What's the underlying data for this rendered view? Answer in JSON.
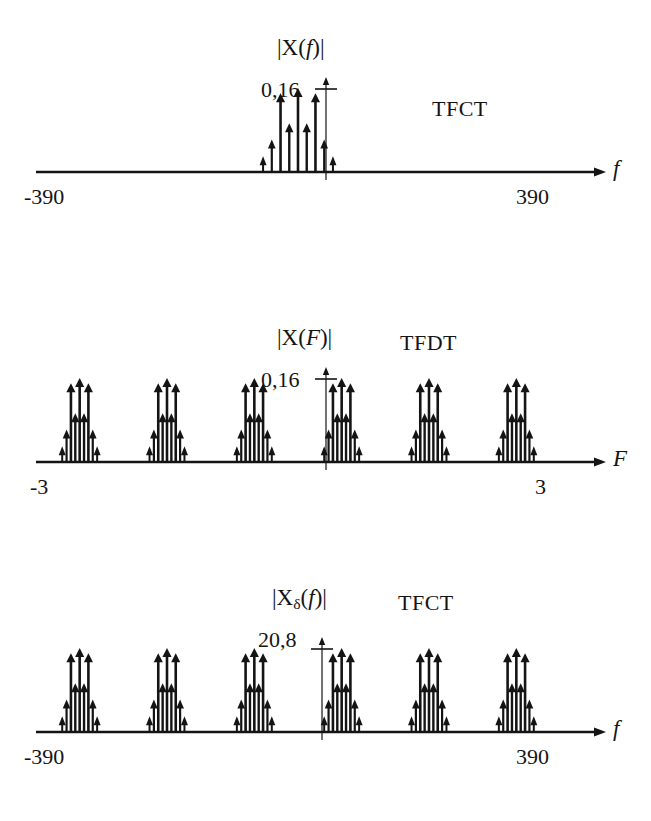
{
  "figure": {
    "background": "#ffffff",
    "ink_color": "#141414"
  },
  "panels": [
    {
      "id": "panel-0",
      "ylabel": "|X(f)|",
      "ylabel_parts": {
        "pre": "|X(",
        "var": "f",
        "post": ")|"
      },
      "ytick_label": "0,16",
      "method_label": "TFCT",
      "axis_var": "f",
      "x_left_label": "-390",
      "x_right_label": "390"
    },
    {
      "id": "panel-1",
      "ylabel": "|X(F)|",
      "ylabel_parts": {
        "pre": "|X(",
        "var": "F",
        "post": ")|"
      },
      "ytick_label": "0,16",
      "method_label": "TFDT",
      "axis_var": "F",
      "x_left_label": "-3",
      "x_right_label": "3"
    },
    {
      "id": "panel-2",
      "ylabel": "|Xδ(f)|",
      "ylabel_parts": {
        "pre": "|X",
        "sub": "δ",
        "mid": "(",
        "var": "f",
        "post": ")|"
      },
      "ytick_label": "20,8",
      "method_label": "TFCT",
      "axis_var": "f",
      "x_left_label": "-390",
      "x_right_label": "390"
    }
  ],
  "chart_data": [
    {
      "type": "line_spectrum",
      "panel": "panel-0",
      "title": "|X(f)|",
      "method": "TFCT",
      "xlabel": "f",
      "ylabel": "|X(f)|",
      "xlim": [
        -390,
        390
      ],
      "ylim": [
        0,
        0.18
      ],
      "ytick_values": [
        0.16
      ],
      "ytick_labels": [
        "0,16"
      ],
      "xtick_values": [
        -390,
        390
      ],
      "xtick_labels": [
        "-390",
        "390"
      ],
      "grid": false,
      "legend": "none",
      "comb_spacing_hz": 13,
      "group_count": 1,
      "lines_per_group": 9,
      "x": [
        -52,
        -39,
        -26,
        -13,
        0,
        13,
        26,
        39,
        52
      ],
      "values": [
        0.03,
        0.062,
        0.15,
        0.093,
        0.16,
        0.093,
        0.15,
        0.062,
        0.03
      ]
    },
    {
      "type": "line_spectrum",
      "panel": "panel-1",
      "title": "|X(F)|",
      "method": "TFDT",
      "xlabel": "F",
      "ylabel": "|X(F)|",
      "xlim": [
        -3,
        3
      ],
      "ylim": [
        0,
        0.18
      ],
      "ytick_values": [
        0.16
      ],
      "ytick_labels": [
        "0,16"
      ],
      "xtick_values": [
        -3,
        3
      ],
      "xtick_labels": [
        "-3",
        "3"
      ],
      "grid": false,
      "legend": "none",
      "periodic": true,
      "period": 1,
      "group_centers": [
        -2.5,
        -1.5,
        -0.5,
        0.5,
        1.5,
        2.5
      ],
      "lines_per_group": 9,
      "group_offsets": [
        -0.2,
        -0.15,
        -0.1,
        -0.05,
        0,
        0.05,
        0.1,
        0.15,
        0.2
      ],
      "group_values": [
        0.03,
        0.062,
        0.15,
        0.093,
        0.16,
        0.093,
        0.15,
        0.062,
        0.03
      ]
    },
    {
      "type": "line_spectrum",
      "panel": "panel-2",
      "title": "|Xδ(f)|",
      "method": "TFCT",
      "xlabel": "f",
      "ylabel": "|Xδ(f)|",
      "xlim": [
        -390,
        390
      ],
      "ylim": [
        0,
        23.4
      ],
      "ytick_values": [
        20.8
      ],
      "ytick_labels": [
        "20,8"
      ],
      "xtick_values": [
        -390,
        390
      ],
      "xtick_labels": [
        "-390",
        "390"
      ],
      "grid": false,
      "legend": "none",
      "periodic": true,
      "period": 130,
      "group_centers": [
        -325,
        -195,
        -65,
        65,
        195,
        325
      ],
      "lines_per_group": 9,
      "group_offsets": [
        -26,
        -19.5,
        -13,
        -6.5,
        0,
        6.5,
        13,
        19.5,
        26
      ],
      "group_values": [
        3.9,
        8.06,
        19.5,
        12.09,
        20.8,
        12.09,
        19.5,
        8.06,
        3.9
      ]
    }
  ]
}
